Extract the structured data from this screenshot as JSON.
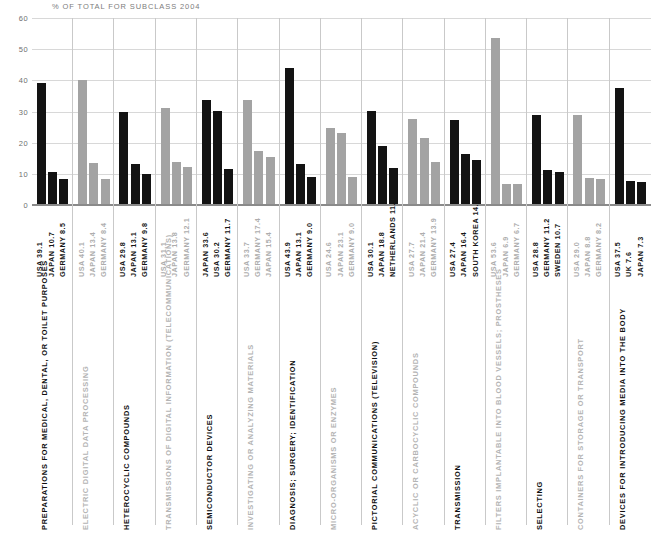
{
  "chart_title": "% OF TOTAL FOR SUBCLASS 2004",
  "colors": {
    "black": "#131313",
    "grey": "#a3a3a3",
    "grid": "#d8d8d8",
    "axis": "#8a8a8a",
    "title": "#7d7d7d"
  },
  "chart_data": {
    "type": "bar",
    "title": "% OF TOTAL FOR SUBCLASS 2004",
    "xlabel": "",
    "ylabel": "",
    "ylim": [
      0,
      60
    ],
    "yticks": [
      0,
      10,
      20,
      30,
      40,
      50,
      60
    ],
    "ytick_labels": [
      "0",
      "10",
      "20",
      "30",
      "40",
      "50",
      "60"
    ],
    "grid": true,
    "legend": "none",
    "orientation": "vertical",
    "note": "15 subclass groups, each with three country bars; groups alternate black / grey emphasis",
    "groups": [
      {
        "category": "PREPARATIONS FOR MEDICAL, DENTAL, OR TOILET PURPOSES",
        "emphasis": "black",
        "bars": [
          {
            "country": "USA",
            "value": 39.1,
            "label": "USA 39.1"
          },
          {
            "country": "JAPAN",
            "value": 10.7,
            "label": "JAPAN 10.7"
          },
          {
            "country": "GERMANY",
            "value": 8.5,
            "label": "GERMANY 8.5"
          }
        ]
      },
      {
        "category": "ELECTRIC DIGITAL DATA PROCESSING",
        "emphasis": "grey",
        "bars": [
          {
            "country": "USA",
            "value": 40.1,
            "label": "USA 40.1"
          },
          {
            "country": "JAPAN",
            "value": 13.4,
            "label": "JAPAN 13.4"
          },
          {
            "country": "GERMANY",
            "value": 8.4,
            "label": "GERMANY 8.4"
          }
        ]
      },
      {
        "category": "HETEROCYCLIC COMPOUNDS",
        "emphasis": "black",
        "bars": [
          {
            "country": "USA",
            "value": 29.8,
            "label": "USA 29.8"
          },
          {
            "country": "JAPAN",
            "value": 13.1,
            "label": "JAPAN 13.1"
          },
          {
            "country": "GERMANY",
            "value": 9.8,
            "label": "GERMANY 9.8"
          }
        ]
      },
      {
        "category": "TRANSMISSIONS OF DIGITAL INFORMATION (TELECOMMUNICATIONS)",
        "emphasis": "grey",
        "bars": [
          {
            "country": "USA",
            "value": 31.1,
            "label": "USA 31.1"
          },
          {
            "country": "JAPAN",
            "value": 13.8,
            "label": "JAPAN 13.8"
          },
          {
            "country": "GERMANY",
            "value": 12.1,
            "label": "GERMANY 12.1"
          }
        ]
      },
      {
        "category": "SEMICONDUCTOR DEVICES",
        "emphasis": "black",
        "bars": [
          {
            "country": "JAPAN",
            "value": 33.6,
            "label": "JAPAN 33.6"
          },
          {
            "country": "USA",
            "value": 30.2,
            "label": "USA 30.2"
          },
          {
            "country": "GERMANY",
            "value": 11.7,
            "label": "GERMANY 11.7"
          }
        ]
      },
      {
        "category": "INVESTIGATING OR ANALYZING MATERIALS",
        "emphasis": "grey",
        "bars": [
          {
            "country": "USA",
            "value": 33.7,
            "label": "USA 33.7"
          },
          {
            "country": "GERMANY",
            "value": 17.4,
            "label": "GERMANY 17.4"
          },
          {
            "country": "JAPAN",
            "value": 15.4,
            "label": "JAPAN 15.4"
          }
        ]
      },
      {
        "category": "DIAGNOSIS; SURGERY; IDENTIFICATION",
        "emphasis": "black",
        "bars": [
          {
            "country": "USA",
            "value": 43.9,
            "label": "USA 43.9"
          },
          {
            "country": "JAPAN",
            "value": 13.1,
            "label": "JAPAN 13.1"
          },
          {
            "country": "GERMANY",
            "value": 9.0,
            "label": "GERMANY 9.0"
          }
        ]
      },
      {
        "category": "MICRO-ORGANISMS OR ENZYMES",
        "emphasis": "grey",
        "bars": [
          {
            "country": "USA",
            "value": 24.6,
            "label": "USA 24.6"
          },
          {
            "country": "JAPAN",
            "value": 23.1,
            "label": "JAPAN 23.1"
          },
          {
            "country": "GERMANY",
            "value": 9.0,
            "label": "GERMANY 9.0"
          }
        ]
      },
      {
        "category": "PICTORIAL COMMUNICATIONS (TELEVISION)",
        "emphasis": "black",
        "bars": [
          {
            "country": "USA",
            "value": 30.1,
            "label": "USA 30.1"
          },
          {
            "country": "JAPAN",
            "value": 18.8,
            "label": "JAPAN 18.8"
          },
          {
            "country": "NETHERLANDS",
            "value": 11.9,
            "label": "NETHERLANDS 11.9"
          }
        ]
      },
      {
        "category": "ACYCLIC OR CARBOCYCLIC COMPOUNDS",
        "emphasis": "grey",
        "bars": [
          {
            "country": "USA",
            "value": 27.7,
            "label": "USA 27.7"
          },
          {
            "country": "JAPAN",
            "value": 21.4,
            "label": "JAPAN 21.4"
          },
          {
            "country": "GERMANY",
            "value": 13.9,
            "label": "GERMANY 13.9"
          }
        ]
      },
      {
        "category": "TRANSMISSION",
        "emphasis": "black",
        "bars": [
          {
            "country": "USA",
            "value": 27.4,
            "label": "USA 27.4"
          },
          {
            "country": "JAPAN",
            "value": 16.4,
            "label": "JAPAN 16.4"
          },
          {
            "country": "SOUTH KOREA",
            "value": 14.5,
            "label": "SOUTH KOREA 14.5"
          }
        ]
      },
      {
        "category": "FILTERS IMPLANTABLE INTO BLOOD VESSELS; PROSTHESES",
        "emphasis": "grey",
        "bars": [
          {
            "country": "USA",
            "value": 53.6,
            "label": "USA 53.6"
          },
          {
            "country": "JAPAN",
            "value": 6.9,
            "label": "JAPAN 6.9"
          },
          {
            "country": "GERMANY",
            "value": 6.7,
            "label": "GERMANY 6.7"
          }
        ]
      },
      {
        "category": "SELECTING",
        "emphasis": "black",
        "bars": [
          {
            "country": "USA",
            "value": 28.8,
            "label": "USA 28.8"
          },
          {
            "country": "GERMANY",
            "value": 11.2,
            "label": "GERMANY 11.2"
          },
          {
            "country": "SWEDEN",
            "value": 10.7,
            "label": "SWEDEN 10.7"
          }
        ]
      },
      {
        "category": "CONTAINERS FOR STORAGE OR TRANSPORT",
        "emphasis": "grey",
        "bars": [
          {
            "country": "USA",
            "value": 29.0,
            "label": "USA 29.0"
          },
          {
            "country": "JAPAN",
            "value": 8.8,
            "label": "JAPAN 8.8"
          },
          {
            "country": "GERMANY",
            "value": 8.2,
            "label": "GERMANY 8.2"
          }
        ]
      },
      {
        "category": "DEVICES FOR INTRODUCING MEDIA INTO THE BODY",
        "emphasis": "black",
        "bars": [
          {
            "country": "USA",
            "value": 37.5,
            "label": "USA 37.5"
          },
          {
            "country": "UK",
            "value": 7.6,
            "label": "UK 7.6"
          },
          {
            "country": "JAPAN",
            "value": 7.3,
            "label": "JAPAN 7.3"
          }
        ]
      }
    ]
  }
}
